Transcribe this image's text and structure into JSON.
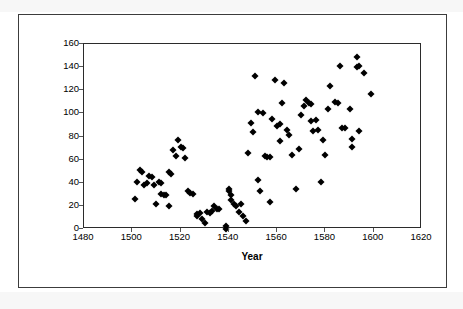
{
  "figure": {
    "x_axis_title": "Year",
    "y_axis_title": ""
  },
  "chart_data": {
    "type": "scatter",
    "title": "",
    "xlabel": "Year",
    "ylabel": "",
    "xlim": [
      1480,
      1620
    ],
    "ylim": [
      0,
      160
    ],
    "xticks": [
      1480,
      1500,
      1520,
      1540,
      1560,
      1580,
      1600,
      1620
    ],
    "yticks": [
      0,
      20,
      40,
      60,
      80,
      100,
      120,
      140,
      160
    ],
    "grid": false,
    "legend": null,
    "marker": "diamond",
    "marker_color": "#000000",
    "points": [
      [
        1501,
        26
      ],
      [
        1502,
        41
      ],
      [
        1503,
        51
      ],
      [
        1504,
        49
      ],
      [
        1505,
        38
      ],
      [
        1506,
        40
      ],
      [
        1507,
        46
      ],
      [
        1508,
        45
      ],
      [
        1509,
        38
      ],
      [
        1510,
        22
      ],
      [
        1511,
        41
      ],
      [
        1512,
        40
      ],
      [
        1512,
        30
      ],
      [
        1513,
        29
      ],
      [
        1514,
        29
      ],
      [
        1515,
        20
      ],
      [
        1515,
        49
      ],
      [
        1516,
        48
      ],
      [
        1517,
        68
      ],
      [
        1518,
        63
      ],
      [
        1519,
        77
      ],
      [
        1520,
        71
      ],
      [
        1521,
        70
      ],
      [
        1522,
        61
      ],
      [
        1523,
        33
      ],
      [
        1524,
        31
      ],
      [
        1525,
        30
      ],
      [
        1527,
        13
      ],
      [
        1527,
        11
      ],
      [
        1528,
        14
      ],
      [
        1529,
        9
      ],
      [
        1530,
        5
      ],
      [
        1531,
        15
      ],
      [
        1532,
        14
      ],
      [
        1533,
        16
      ],
      [
        1534,
        20
      ],
      [
        1535,
        17
      ],
      [
        1536,
        17
      ],
      [
        1539,
        3
      ],
      [
        1539,
        0
      ],
      [
        1540,
        35
      ],
      [
        1540,
        33
      ],
      [
        1541,
        29
      ],
      [
        1541,
        25
      ],
      [
        1542,
        22
      ],
      [
        1543,
        20
      ],
      [
        1544,
        15
      ],
      [
        1545,
        22
      ],
      [
        1546,
        11
      ],
      [
        1547,
        7
      ],
      [
        1548,
        66
      ],
      [
        1549,
        92
      ],
      [
        1550,
        84
      ],
      [
        1551,
        132
      ],
      [
        1552,
        101
      ],
      [
        1552,
        42
      ],
      [
        1553,
        33
      ],
      [
        1554,
        100
      ],
      [
        1555,
        63
      ],
      [
        1556,
        62
      ],
      [
        1557,
        62
      ],
      [
        1557,
        23
      ],
      [
        1558,
        95
      ],
      [
        1559,
        129
      ],
      [
        1560,
        89
      ],
      [
        1561,
        91
      ],
      [
        1561,
        76
      ],
      [
        1562,
        109
      ],
      [
        1563,
        126
      ],
      [
        1564,
        86
      ],
      [
        1565,
        81
      ],
      [
        1566,
        64
      ],
      [
        1568,
        35
      ],
      [
        1569,
        69
      ],
      [
        1570,
        99
      ],
      [
        1571,
        106
      ],
      [
        1572,
        112
      ],
      [
        1573,
        109
      ],
      [
        1574,
        108
      ],
      [
        1574,
        93
      ],
      [
        1575,
        85
      ],
      [
        1576,
        94
      ],
      [
        1577,
        86
      ],
      [
        1578,
        41
      ],
      [
        1579,
        77
      ],
      [
        1580,
        64
      ],
      [
        1581,
        104
      ],
      [
        1582,
        124
      ],
      [
        1584,
        110
      ],
      [
        1585,
        109
      ],
      [
        1586,
        141
      ],
      [
        1587,
        87
      ],
      [
        1588,
        87
      ],
      [
        1590,
        104
      ],
      [
        1591,
        78
      ],
      [
        1591,
        71
      ],
      [
        1593,
        140
      ],
      [
        1593,
        149
      ],
      [
        1594,
        141
      ],
      [
        1594,
        85
      ],
      [
        1596,
        135
      ],
      [
        1599,
        117
      ]
    ]
  }
}
